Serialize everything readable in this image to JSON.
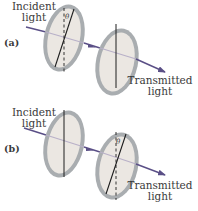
{
  "figure": {
    "panels": [
      {
        "id": "a",
        "label": "(a)",
        "incident_label": [
          "Incident",
          "light"
        ],
        "transmitted_label": [
          "Transmitted",
          "light"
        ],
        "first_polarizer": {
          "axis": "tilted",
          "angle_label": "θ"
        },
        "second_polarizer": {
          "axis": "vertical"
        }
      },
      {
        "id": "b",
        "label": "(b)",
        "incident_label": [
          "Incident",
          "light"
        ],
        "transmitted_label": [
          "Transmitted",
          "light"
        ],
        "first_polarizer": {
          "axis": "vertical"
        },
        "second_polarizer": {
          "axis": "tilted",
          "angle_label": "θ"
        }
      }
    ],
    "colors": {
      "disc_rim": "#a9adb0",
      "disc_face": "#ebe7e2",
      "beam": "#5a4f86",
      "axis_line": "#1e1e1e"
    }
  }
}
